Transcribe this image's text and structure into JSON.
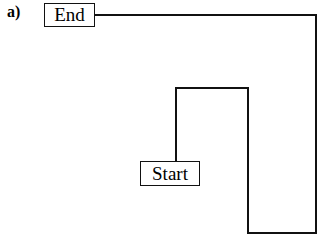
{
  "figure": {
    "panel_label": "a)",
    "background_color": "#ffffff",
    "stroke_color": "#111111",
    "width": 321,
    "height": 238
  },
  "nodes": {
    "start": {
      "label": "Start",
      "x": 140,
      "y": 161,
      "width": 60,
      "height": 25
    },
    "end": {
      "label": "End",
      "x": 44,
      "y": 3,
      "width": 51,
      "height": 24
    }
  },
  "route": {
    "description": "Orthogonal path from Start box to End box",
    "stroke_width": 2,
    "points": [
      [
        176,
        161
      ],
      [
        176,
        88
      ],
      [
        248,
        88
      ],
      [
        248,
        233
      ],
      [
        316,
        233
      ],
      [
        316,
        15
      ],
      [
        95,
        15
      ]
    ]
  }
}
